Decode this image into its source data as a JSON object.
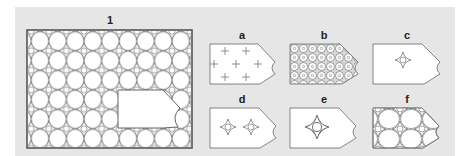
{
  "figure": {
    "main_panel": {
      "label": "1",
      "description": "Tiled grid of circles with four-pointed stars at intersections; a blank tag-shaped region is cut out in the lower right",
      "grid_columns": 9,
      "grid_rows": 6
    },
    "options": [
      {
        "label": "a",
        "pattern": "plus-signs"
      },
      {
        "label": "b",
        "pattern": "dense-circles-with-dots"
      },
      {
        "label": "c",
        "pattern": "single-star"
      },
      {
        "label": "d",
        "pattern": "two-stars"
      },
      {
        "label": "e",
        "pattern": "single-large-star"
      },
      {
        "label": "f",
        "pattern": "circles-and-stars"
      }
    ]
  },
  "colors": {
    "panel_bg": "#e6e6e6",
    "frame": "#555555",
    "line": "#666666",
    "fill": "#ffffff"
  }
}
